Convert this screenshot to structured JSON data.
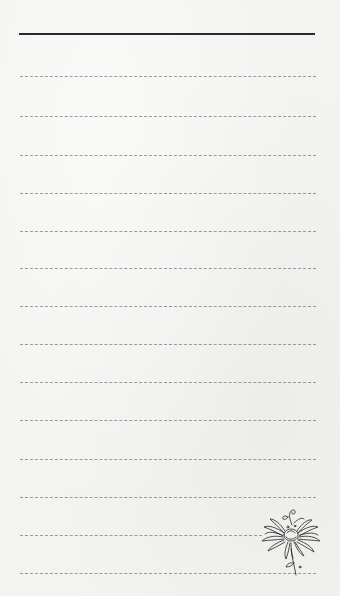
{
  "page": {
    "background_color": "#f3f3f1",
    "header_line": {
      "top": 33,
      "left": 19,
      "width": 296,
      "color": "#2a2a2a"
    },
    "rules": [
      {
        "top": 76,
        "left": 20,
        "width": 296
      },
      {
        "top": 116,
        "left": 20,
        "width": 296
      },
      {
        "top": 155,
        "left": 20,
        "width": 296
      },
      {
        "top": 193,
        "left": 20,
        "width": 296
      },
      {
        "top": 231,
        "left": 20,
        "width": 296
      },
      {
        "top": 268,
        "left": 20,
        "width": 296
      },
      {
        "top": 306,
        "left": 20,
        "width": 296
      },
      {
        "top": 344,
        "left": 20,
        "width": 296
      },
      {
        "top": 382,
        "left": 20,
        "width": 296
      },
      {
        "top": 420,
        "left": 20,
        "width": 296
      },
      {
        "top": 459,
        "left": 20,
        "width": 296
      },
      {
        "top": 497,
        "left": 20,
        "width": 296
      },
      {
        "top": 535,
        "left": 20,
        "width": 242
      },
      {
        "top": 573,
        "left": 20,
        "width": 296
      }
    ],
    "rule_color": "#8a8a8a",
    "decoration": {
      "icon": "chrysanthemum-flower-icon",
      "position": "bottom-right"
    }
  }
}
